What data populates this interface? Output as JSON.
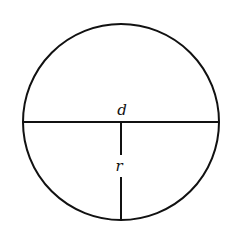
{
  "diagram": {
    "type": "geometry-circle",
    "colors": {
      "stroke": "#111111",
      "background": "#ffffff"
    },
    "circle": {
      "cx": 121,
      "cy": 122,
      "r": 98
    },
    "labels": {
      "diameter": "d",
      "radius": "r"
    }
  }
}
